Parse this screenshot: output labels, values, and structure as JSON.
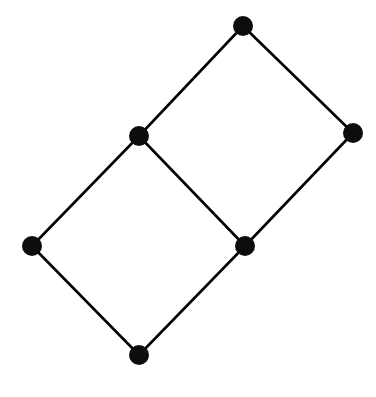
{
  "figure": {
    "width": 376,
    "height": 397,
    "background_color": "#ffffff"
  },
  "chart_data": {
    "type": "diagram",
    "subtype": "node-link-graph",
    "title": "",
    "xlabel": "",
    "ylabel": "",
    "grid": false,
    "legend": null,
    "axis_visible": false,
    "node_count": 6,
    "edge_count": 7,
    "node_style": {
      "shape": "circle",
      "radius": 10,
      "fill": "#0d0d0d",
      "stroke": "none"
    },
    "edge_style": {
      "stroke": "#000000",
      "stroke_width": 2.6,
      "linecap": "round"
    },
    "nodes": [
      {
        "id": "top",
        "label": "",
        "x": 243,
        "y": 26,
        "degree": 2
      },
      {
        "id": "right",
        "label": "",
        "x": 353,
        "y": 133,
        "degree": 2
      },
      {
        "id": "upper_mid",
        "label": "",
        "x": 139,
        "y": 136,
        "degree": 3
      },
      {
        "id": "center",
        "label": "",
        "x": 245,
        "y": 246,
        "degree": 3
      },
      {
        "id": "left",
        "label": "",
        "x": 32,
        "y": 246,
        "degree": 2
      },
      {
        "id": "bottom",
        "label": "",
        "x": 139,
        "y": 355,
        "degree": 2
      }
    ],
    "edges": [
      {
        "source": "top",
        "target": "upper_mid"
      },
      {
        "source": "top",
        "target": "right"
      },
      {
        "source": "right",
        "target": "center"
      },
      {
        "source": "upper_mid",
        "target": "center"
      },
      {
        "source": "upper_mid",
        "target": "left"
      },
      {
        "source": "center",
        "target": "bottom"
      },
      {
        "source": "left",
        "target": "bottom"
      }
    ],
    "faces": [
      {
        "id": "upper-right-quad",
        "nodes": [
          "top",
          "right",
          "center",
          "upper_mid"
        ]
      },
      {
        "id": "lower-left-quad",
        "nodes": [
          "upper_mid",
          "center",
          "bottom",
          "left"
        ]
      }
    ]
  }
}
